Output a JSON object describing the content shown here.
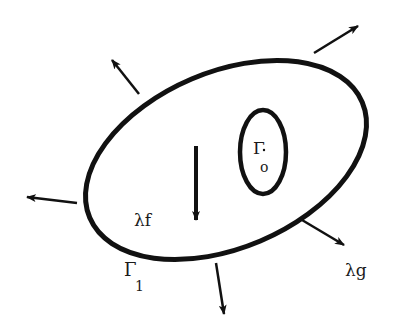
{
  "diagram": {
    "outer_boundary": {
      "label": "Γ",
      "subscript": "1"
    },
    "inner_boundary": {
      "label": "Γ",
      "subscript": "o"
    },
    "body_force_label": "λf",
    "traction_label": "λg",
    "colors": {
      "stroke": "#111111",
      "background": "#ffffff"
    }
  }
}
